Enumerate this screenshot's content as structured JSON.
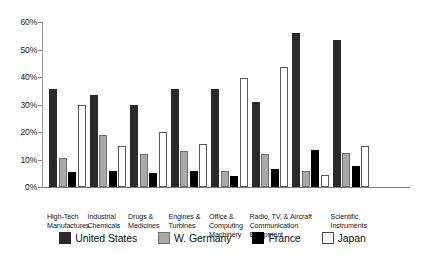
{
  "chart_data": {
    "type": "bar",
    "title": "",
    "subtitle": "",
    "xlabel": "",
    "ylabel": "",
    "ylim": [
      0,
      60
    ],
    "ytick_labels": [
      "0%",
      "10%",
      "20%",
      "30%",
      "40%",
      "50%",
      "60%"
    ],
    "ytick_values": [
      0,
      10,
      20,
      30,
      40,
      50,
      60
    ],
    "grid": false,
    "legend_position": "bottom",
    "categories": [
      "High-Tech Manufactures",
      "Industrial Chemicals",
      "Drugs & Medicines",
      "Engines & Turbines",
      "Office & Computing Machinery",
      "Radio, TV, & Communication Equipment",
      "Aircraft",
      "Scientific Instruments"
    ],
    "category_label_lines": [
      [
        "High-Tech",
        "Manufactures"
      ],
      [
        "Industrial",
        "Chemicals"
      ],
      [
        "Drugs &",
        "Medicines"
      ],
      [
        "Engines &",
        "Turbines"
      ],
      [
        "Office &",
        "Computing",
        "Machinery"
      ],
      [
        "Radio, TV, &",
        "Communication",
        "Equipment"
      ],
      [
        "Aircraft"
      ],
      [
        "Scientific",
        "Instruments"
      ]
    ],
    "series": [
      {
        "name": "United States",
        "key": "us",
        "color": "#2a2a2a",
        "values": [
          35.5,
          33.5,
          30.0,
          35.5,
          35.5,
          31.0,
          56.0,
          53.5
        ]
      },
      {
        "name": "W. Germany",
        "key": "germany",
        "color": "#a9a9a9",
        "values": [
          10.5,
          19.0,
          12.0,
          13.0,
          6.0,
          12.0,
          6.0,
          12.5
        ]
      },
      {
        "name": "France",
        "key": "france",
        "color": "#000000",
        "values": [
          5.5,
          6.0,
          5.0,
          6.0,
          4.0,
          6.5,
          13.5,
          7.5
        ]
      },
      {
        "name": "Japan",
        "key": "japan",
        "color": "#ffffff",
        "values": [
          30.0,
          15.0,
          20.0,
          15.5,
          39.5,
          43.5,
          4.5,
          15.0
        ]
      }
    ]
  },
  "legend": {
    "items": [
      {
        "label": "United States",
        "key": "us"
      },
      {
        "label": "W. Germany",
        "key": "germany"
      },
      {
        "label": "France",
        "key": "france"
      },
      {
        "label": "Japan",
        "key": "japan"
      }
    ]
  }
}
